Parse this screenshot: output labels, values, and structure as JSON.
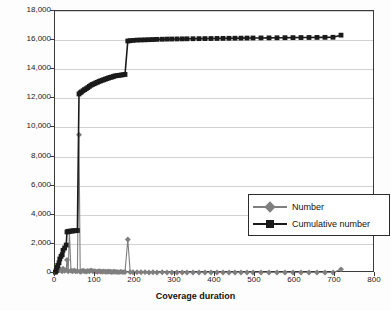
{
  "chart_data": {
    "type": "line",
    "title": "",
    "xlabel": "Coverage duration",
    "ylabel": "Frequency",
    "xlim": [
      0,
      800
    ],
    "ylim": [
      0,
      18000
    ],
    "xticks": [
      0,
      100,
      200,
      300,
      400,
      500,
      600,
      700,
      800
    ],
    "xtick_labels": [
      "0",
      "100",
      "200",
      "300",
      "400",
      "500",
      "600",
      "700",
      "800"
    ],
    "yticks": [
      0,
      2000,
      4000,
      6000,
      8000,
      10000,
      12000,
      14000,
      16000,
      18000
    ],
    "ytick_labels": [
      "0",
      "2,000",
      "4,000",
      "6,000",
      "8,000",
      "10,000",
      "12,000",
      "14,000",
      "16,000",
      "18,000"
    ],
    "grid": "horizontal",
    "legend_position": "inside-center-right",
    "series": [
      {
        "name": "Number",
        "marker": "diamond",
        "color": "#7f7f7f",
        "points": [
          [
            1,
            60
          ],
          [
            3,
            120
          ],
          [
            5,
            200
          ],
          [
            7,
            140
          ],
          [
            10,
            180
          ],
          [
            12,
            260
          ],
          [
            15,
            180
          ],
          [
            18,
            120
          ],
          [
            20,
            300
          ],
          [
            24,
            160
          ],
          [
            28,
            200
          ],
          [
            30,
            900
          ],
          [
            33,
            120
          ],
          [
            36,
            2800
          ],
          [
            40,
            150
          ],
          [
            44,
            120
          ],
          [
            48,
            180
          ],
          [
            52,
            110
          ],
          [
            56,
            140
          ],
          [
            60,
            9500
          ],
          [
            63,
            90
          ],
          [
            66,
            120
          ],
          [
            70,
            160
          ],
          [
            74,
            120
          ],
          [
            78,
            100
          ],
          [
            82,
            140
          ],
          [
            86,
            120
          ],
          [
            90,
            180
          ],
          [
            94,
            130
          ],
          [
            98,
            120
          ],
          [
            102,
            110
          ],
          [
            106,
            90
          ],
          [
            110,
            120
          ],
          [
            114,
            100
          ],
          [
            118,
            90
          ],
          [
            122,
            110
          ],
          [
            126,
            80
          ],
          [
            130,
            90
          ],
          [
            134,
            100
          ],
          [
            138,
            80
          ],
          [
            142,
            70
          ],
          [
            146,
            90
          ],
          [
            150,
            80
          ],
          [
            155,
            70
          ],
          [
            160,
            60
          ],
          [
            165,
            80
          ],
          [
            170,
            60
          ],
          [
            175,
            70
          ],
          [
            182,
            2300
          ],
          [
            188,
            60
          ],
          [
            195,
            50
          ],
          [
            205,
            60
          ],
          [
            215,
            50
          ],
          [
            225,
            60
          ],
          [
            235,
            40
          ],
          [
            245,
            50
          ],
          [
            255,
            40
          ],
          [
            268,
            50
          ],
          [
            280,
            40
          ],
          [
            292,
            40
          ],
          [
            305,
            40
          ],
          [
            318,
            30
          ],
          [
            330,
            40
          ],
          [
            345,
            30
          ],
          [
            360,
            40
          ],
          [
            375,
            30
          ],
          [
            390,
            30
          ],
          [
            405,
            40
          ],
          [
            420,
            30
          ],
          [
            435,
            30
          ],
          [
            450,
            30
          ],
          [
            465,
            30
          ],
          [
            480,
            30
          ],
          [
            495,
            30
          ],
          [
            515,
            30
          ],
          [
            535,
            30
          ],
          [
            555,
            30
          ],
          [
            575,
            30
          ],
          [
            595,
            30
          ],
          [
            615,
            30
          ],
          [
            635,
            30
          ],
          [
            655,
            30
          ],
          [
            675,
            30
          ],
          [
            695,
            30
          ],
          [
            715,
            250
          ]
        ]
      },
      {
        "name": "Cumulative number",
        "marker": "square",
        "color": "#1a1a1a",
        "points": [
          [
            1,
            60
          ],
          [
            3,
            180
          ],
          [
            5,
            380
          ],
          [
            7,
            520
          ],
          [
            10,
            700
          ],
          [
            12,
            960
          ],
          [
            15,
            1140
          ],
          [
            18,
            1260
          ],
          [
            20,
            1560
          ],
          [
            24,
            1720
          ],
          [
            28,
            1920
          ],
          [
            30,
            2820
          ],
          [
            33,
            2860
          ],
          [
            36,
            2870
          ],
          [
            40,
            2880
          ],
          [
            44,
            2890
          ],
          [
            48,
            2900
          ],
          [
            52,
            2910
          ],
          [
            56,
            2920
          ],
          [
            60,
            12300
          ],
          [
            63,
            12380
          ],
          [
            66,
            12440
          ],
          [
            70,
            12520
          ],
          [
            74,
            12600
          ],
          [
            78,
            12660
          ],
          [
            82,
            12740
          ],
          [
            86,
            12820
          ],
          [
            90,
            12900
          ],
          [
            94,
            12960
          ],
          [
            98,
            13000
          ],
          [
            102,
            13060
          ],
          [
            106,
            13100
          ],
          [
            110,
            13160
          ],
          [
            114,
            13200
          ],
          [
            118,
            13240
          ],
          [
            122,
            13280
          ],
          [
            126,
            13320
          ],
          [
            130,
            13360
          ],
          [
            134,
            13400
          ],
          [
            138,
            13440
          ],
          [
            142,
            13460
          ],
          [
            146,
            13500
          ],
          [
            150,
            13540
          ],
          [
            155,
            13560
          ],
          [
            160,
            13580
          ],
          [
            165,
            13600
          ],
          [
            170,
            13620
          ],
          [
            175,
            13640
          ],
          [
            182,
            15940
          ],
          [
            188,
            15960
          ],
          [
            195,
            15980
          ],
          [
            205,
            16000
          ],
          [
            215,
            16010
          ],
          [
            225,
            16020
          ],
          [
            235,
            16030
          ],
          [
            245,
            16040
          ],
          [
            255,
            16050
          ],
          [
            268,
            16060
          ],
          [
            280,
            16070
          ],
          [
            292,
            16075
          ],
          [
            305,
            16080
          ],
          [
            318,
            16085
          ],
          [
            330,
            16090
          ],
          [
            345,
            16095
          ],
          [
            360,
            16100
          ],
          [
            375,
            16105
          ],
          [
            390,
            16110
          ],
          [
            405,
            16115
          ],
          [
            420,
            16120
          ],
          [
            435,
            16125
          ],
          [
            450,
            16130
          ],
          [
            465,
            16135
          ],
          [
            480,
            16140
          ],
          [
            495,
            16145
          ],
          [
            515,
            16150
          ],
          [
            535,
            16155
          ],
          [
            555,
            16160
          ],
          [
            575,
            16165
          ],
          [
            595,
            16170
          ],
          [
            615,
            16175
          ],
          [
            635,
            16180
          ],
          [
            655,
            16185
          ],
          [
            675,
            16190
          ],
          [
            695,
            16195
          ],
          [
            715,
            16340
          ]
        ]
      }
    ]
  },
  "legend": {
    "items": [
      {
        "label": "Number"
      },
      {
        "label": "Cumulative number"
      }
    ]
  },
  "axes": {
    "y_title": "Frequency",
    "x_title": "Coverage duration"
  }
}
